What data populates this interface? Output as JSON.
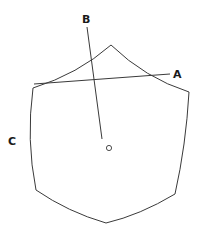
{
  "diagram": {
    "labels": {
      "a": "A",
      "b": "B",
      "c": "C"
    },
    "center_marker": "circle-point",
    "colors": {
      "stroke": "#3a3a3a",
      "label": "#1a1a1a",
      "background": "#ffffff"
    }
  }
}
